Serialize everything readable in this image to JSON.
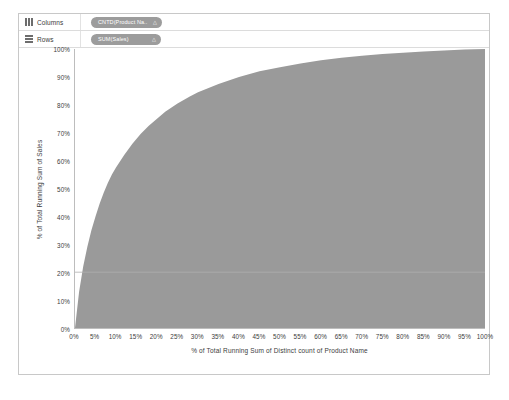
{
  "shelves": [
    {
      "name": "columns",
      "label": "Columns",
      "icon": "columns-grid-icon",
      "pill": {
        "text": "CNTD(Product Na..",
        "caret": "△"
      }
    },
    {
      "name": "rows",
      "label": "Rows",
      "icon": "rows-grid-icon",
      "pill": {
        "text": "SUM(Sales)",
        "caret": "△"
      }
    }
  ],
  "chart_data": {
    "type": "area",
    "title": "",
    "xlabel": "% of Total Running Sum of Distinct count of Product Name",
    "ylabel": "% of Total Running Sum of Sales",
    "xlim": [
      0,
      100
    ],
    "ylim": [
      0,
      100
    ],
    "grid": false,
    "legend": null,
    "fill_color": "#9a9a9a",
    "axis_color": "#bdbdbd",
    "x_ticks": [
      "0%",
      "5%",
      "10%",
      "15%",
      "20%",
      "25%",
      "30%",
      "35%",
      "40%",
      "45%",
      "50%",
      "55%",
      "60%",
      "65%",
      "70%",
      "75%",
      "80%",
      "85%",
      "90%",
      "95%",
      "100%"
    ],
    "x_tick_values": [
      0,
      5,
      10,
      15,
      20,
      25,
      30,
      35,
      40,
      45,
      50,
      55,
      60,
      65,
      70,
      75,
      80,
      85,
      90,
      95,
      100
    ],
    "y_ticks": [
      "0%",
      "10%",
      "20%",
      "30%",
      "40%",
      "50%",
      "60%",
      "70%",
      "80%",
      "90%",
      "100%"
    ],
    "y_tick_values": [
      0,
      10,
      20,
      30,
      40,
      50,
      60,
      70,
      80,
      90,
      100
    ],
    "series": [
      {
        "name": "% of Total Running Sum of Sales",
        "x": [
          0,
          1,
          2,
          3,
          4,
          5,
          6,
          7,
          8,
          9,
          10,
          12,
          14,
          16,
          18,
          20,
          22,
          25,
          28,
          30,
          35,
          40,
          45,
          50,
          55,
          60,
          65,
          70,
          75,
          80,
          85,
          90,
          95,
          100
        ],
        "values": [
          0,
          13,
          22,
          29,
          35,
          40,
          44.5,
          48.5,
          52,
          55,
          57.5,
          62,
          66,
          69.5,
          72.5,
          75,
          77.5,
          80.5,
          83,
          84.5,
          87.5,
          90,
          92,
          93.5,
          94.8,
          96,
          96.9,
          97.6,
          98.2,
          98.7,
          99.1,
          99.5,
          99.8,
          100
        ]
      }
    ]
  }
}
